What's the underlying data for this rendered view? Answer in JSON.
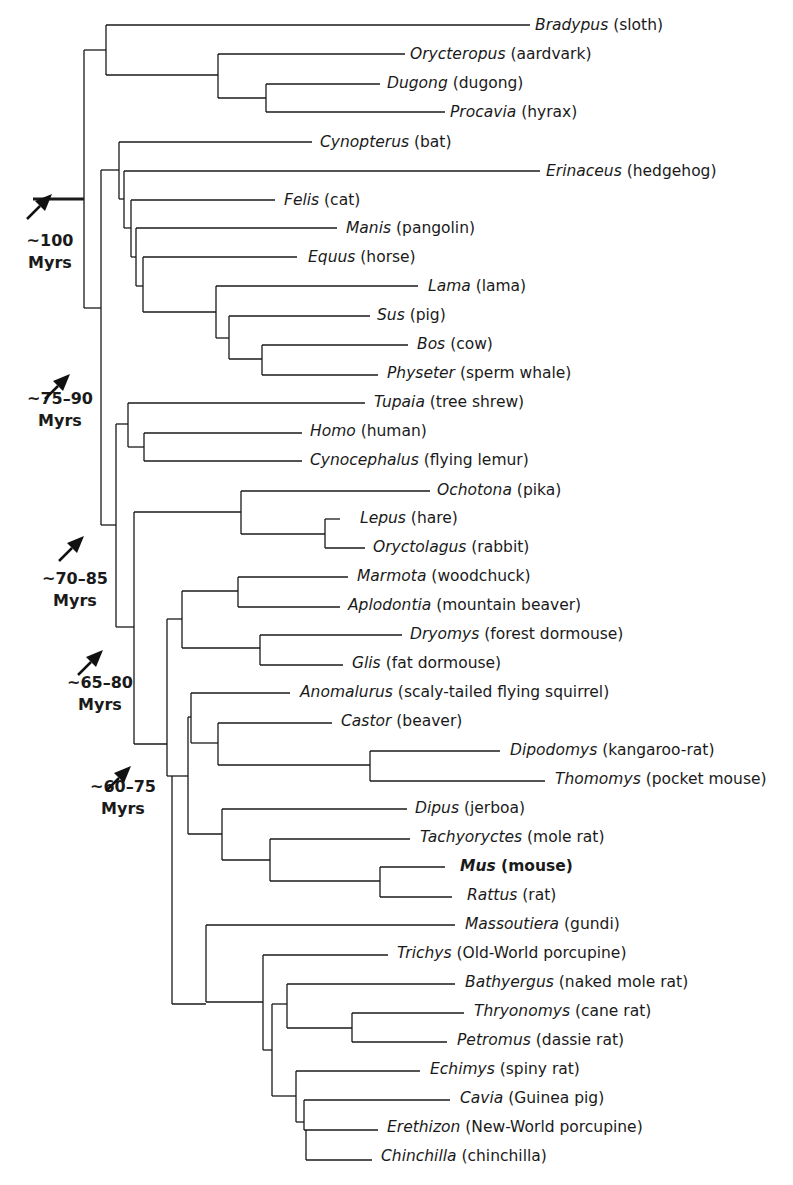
{
  "figure": {
    "line_color": "#1a1a1a",
    "leaves": [
      {
        "genus": "Bradypus",
        "common": "(sloth)",
        "y": 25,
        "x": 535
      },
      {
        "genus": "Orycteropus",
        "common": "(aardvark)",
        "y": 54,
        "x": 410
      },
      {
        "genus": "Dugong",
        "common": "(dugong)",
        "y": 83,
        "x": 387
      },
      {
        "genus": "Procavia",
        "common": "(hyrax)",
        "y": 112,
        "x": 450
      },
      {
        "genus": "Cynopterus",
        "common": "(bat)",
        "y": 142,
        "x": 320
      },
      {
        "genus": "Erinaceus",
        "common": "(hedgehog)",
        "y": 171,
        "x": 546
      },
      {
        "genus": "Felis",
        "common": "(cat)",
        "y": 200,
        "x": 284
      },
      {
        "genus": "Manis",
        "common": "(pangolin)",
        "y": 228,
        "x": 346
      },
      {
        "genus": "Equus",
        "common": "(horse)",
        "y": 257,
        "x": 308
      },
      {
        "genus": "Lama",
        "common": "(lama)",
        "y": 286,
        "x": 428
      },
      {
        "genus": "Sus",
        "common": "(pig)",
        "y": 315,
        "x": 377
      },
      {
        "genus": "Bos",
        "common": "(cow)",
        "y": 344,
        "x": 417
      },
      {
        "genus": "Physeter",
        "common": "(sperm whale)",
        "y": 373,
        "x": 387
      },
      {
        "genus": "Tupaia",
        "common": "(tree shrew)",
        "y": 402,
        "x": 374
      },
      {
        "genus": "Homo",
        "common": "(human)",
        "y": 431,
        "x": 310
      },
      {
        "genus": "Cynocephalus",
        "common": "(flying lemur)",
        "y": 460,
        "x": 310
      },
      {
        "genus": "Ochotona",
        "common": "(pika)",
        "y": 490,
        "x": 437
      },
      {
        "genus": "Lepus",
        "common": "(hare)",
        "y": 518,
        "x": 360
      },
      {
        "genus": "Oryctolagus",
        "common": "(rabbit)",
        "y": 547,
        "x": 373
      },
      {
        "genus": "Marmota",
        "common": "(woodchuck)",
        "y": 576,
        "x": 357
      },
      {
        "genus": "Aplodontia",
        "common": "(mountain beaver)",
        "y": 605,
        "x": 348
      },
      {
        "genus": "Dryomys",
        "common": "(forest dormouse)",
        "y": 634,
        "x": 410
      },
      {
        "genus": "Glis",
        "common": "(fat dormouse)",
        "y": 663,
        "x": 352
      },
      {
        "genus": "Anomalurus",
        "common": "(scaly-tailed flying squirrel)",
        "y": 692,
        "x": 300
      },
      {
        "genus": "Castor",
        "common": "(beaver)",
        "y": 721,
        "x": 341
      },
      {
        "genus": "Dipodomys",
        "common": "(kangaroo-rat)",
        "y": 750,
        "x": 510
      },
      {
        "genus": "Thomomys",
        "common": "(pocket mouse)",
        "y": 779,
        "x": 555
      },
      {
        "genus": "Dipus",
        "common": "(jerboa)",
        "y": 808,
        "x": 415
      },
      {
        "genus": "Tachyoryctes",
        "common": "(mole rat)",
        "y": 837,
        "x": 420
      },
      {
        "genus": "Mus",
        "common": "(mouse)",
        "y": 866,
        "x": 460,
        "bold": true
      },
      {
        "genus": "Rattus",
        "common": "(rat)",
        "y": 895,
        "x": 467
      },
      {
        "genus": "Massoutiera",
        "common": "(gundi)",
        "y": 924,
        "x": 465
      },
      {
        "genus": "Trichys",
        "common": "(Old-World porcupine)",
        "y": 953,
        "x": 397
      },
      {
        "genus": "Bathyergus",
        "common": "(naked mole rat)",
        "y": 982,
        "x": 465
      },
      {
        "genus": "Thryonomys",
        "common": "(cane rat)",
        "y": 1011,
        "x": 474
      },
      {
        "genus": "Petromus",
        "common": "(dassie rat)",
        "y": 1040,
        "x": 457
      },
      {
        "genus": "Echimys",
        "common": "(spiny rat)",
        "y": 1069,
        "x": 430
      },
      {
        "genus": "Cavia",
        "common": "(Guinea pig)",
        "y": 1098,
        "x": 460
      },
      {
        "genus": "Erethizon",
        "common": "(New-World porcupine)",
        "y": 1127,
        "x": 387
      },
      {
        "genus": "Chinchilla",
        "common": "(chinchilla)",
        "y": 1156,
        "x": 381
      }
    ],
    "age_annotations": [
      {
        "line1": "~100",
        "line2": "Myrs",
        "x": 5,
        "y": 230,
        "arrow_x": 52,
        "arrow_y": 180
      },
      {
        "line1": "~75–90",
        "line2": "Myrs",
        "x": 15,
        "y": 388,
        "arrow_x": 70,
        "arrow_y": 360
      },
      {
        "line1": "~70–85",
        "line2": "Myrs",
        "x": 30,
        "y": 568,
        "arrow_x": 84,
        "arrow_y": 522
      },
      {
        "line1": "~65–80",
        "line2": "Myrs",
        "x": 55,
        "y": 672,
        "arrow_x": 103,
        "arrow_y": 636
      },
      {
        "line1": "~60–75",
        "line2": "Myrs",
        "x": 78,
        "y": 776,
        "arrow_x": 131,
        "arrow_y": 752
      }
    ]
  }
}
